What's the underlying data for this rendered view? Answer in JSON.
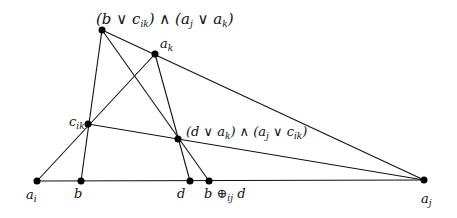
{
  "diagram": {
    "type": "projective-geometry-construction",
    "points": [
      {
        "id": "top",
        "x": 102,
        "y": 30,
        "label": "(b ∨ c_ik) ∧ (a_j ∨ a_k)"
      },
      {
        "id": "ak",
        "x": 155,
        "y": 54,
        "label": "a_k"
      },
      {
        "id": "cik",
        "x": 88,
        "y": 124,
        "label": "c_ik"
      },
      {
        "id": "mid",
        "x": 178,
        "y": 139,
        "label": "(d ∨ a_k) ∧ (a_j ∨ c_ik)"
      },
      {
        "id": "ai",
        "x": 37,
        "y": 181,
        "label": "a_i"
      },
      {
        "id": "b",
        "x": 81,
        "y": 181,
        "label": "b"
      },
      {
        "id": "d",
        "x": 190,
        "y": 181,
        "label": "d"
      },
      {
        "id": "bd",
        "x": 209,
        "y": 181,
        "label": "b ⊕_ij d"
      },
      {
        "id": "aj",
        "x": 424,
        "y": 180,
        "label": "a_j"
      }
    ],
    "lines": [
      [
        "ai",
        "aj"
      ],
      [
        "ai",
        "ak"
      ],
      [
        "top",
        "b"
      ],
      [
        "top",
        "aj"
      ],
      [
        "top",
        "bd"
      ],
      [
        "ak",
        "d"
      ],
      [
        "cik",
        "aj"
      ]
    ],
    "labels": {
      "top_pre": "(b ∨ c",
      "top_sub1": "ik",
      "top_mid": ") ∧ (a",
      "top_sub2": "j",
      "top_mid2": " ∨ a",
      "top_sub3": "k",
      "top_end": ")",
      "ak_main": "a",
      "ak_sub": "k",
      "cik_main": "c",
      "cik_sub": "ik",
      "mid_pre": "(d ∨ a",
      "mid_sub1": "k",
      "mid_mid": ") ∧ (a",
      "mid_sub2": "j",
      "mid_mid2": " ∨ c",
      "mid_sub3": "ik",
      "mid_end": ")",
      "ai_main": "a",
      "ai_sub": "i",
      "b": "b",
      "d": "d",
      "bd_pre": "b ⊕",
      "bd_sub": "ij",
      "bd_end": " d",
      "aj_main": "a",
      "aj_sub": "j"
    },
    "colors": {
      "stroke": "#111111",
      "point": "#000000",
      "background": "#ffffff"
    }
  }
}
